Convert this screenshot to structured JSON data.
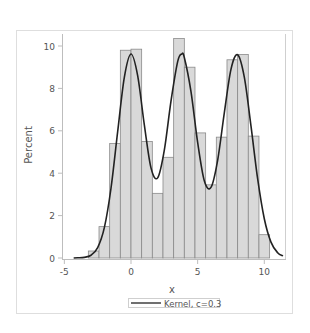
{
  "chart_data": {
    "type": "bar",
    "subtype": "histogram_with_kernel_density",
    "title": "",
    "xlabel": "x",
    "ylabel": "Percent",
    "xlim": [
      -5,
      11.5
    ],
    "ylim": [
      0,
      10.5
    ],
    "xticks": [
      -5,
      0,
      5,
      10
    ],
    "yticks": [
      0,
      2,
      4,
      6,
      8,
      10
    ],
    "grid": false,
    "legend_position": "bottom-center",
    "bin_width": 0.8,
    "bins": [
      {
        "left": -3.2,
        "right": -2.4,
        "value": 0.33
      },
      {
        "left": -2.4,
        "right": -1.6,
        "value": 1.48
      },
      {
        "left": -1.6,
        "right": -0.8,
        "value": 5.4
      },
      {
        "left": -0.8,
        "right": 0.0,
        "value": 9.8
      },
      {
        "left": 0.0,
        "right": 0.8,
        "value": 9.85
      },
      {
        "left": 0.8,
        "right": 1.6,
        "value": 5.5
      },
      {
        "left": 1.6,
        "right": 2.4,
        "value": 3.05
      },
      {
        "left": 2.4,
        "right": 3.2,
        "value": 4.75
      },
      {
        "left": 3.2,
        "right": 4.0,
        "value": 10.35
      },
      {
        "left": 4.0,
        "right": 4.8,
        "value": 9.0
      },
      {
        "left": 4.8,
        "right": 5.6,
        "value": 5.9
      },
      {
        "left": 5.6,
        "right": 6.4,
        "value": 3.45
      },
      {
        "left": 6.4,
        "right": 7.2,
        "value": 5.7
      },
      {
        "left": 7.2,
        "right": 8.0,
        "value": 9.35
      },
      {
        "left": 8.0,
        "right": 8.8,
        "value": 9.6
      },
      {
        "left": 8.8,
        "right": 9.6,
        "value": 5.75
      },
      {
        "left": 9.6,
        "right": 10.4,
        "value": 1.1
      }
    ],
    "categories": [
      "-2.8",
      "-2.0",
      "-1.2",
      "-0.4",
      "0.4",
      "1.2",
      "2.0",
      "2.8",
      "3.6",
      "4.4",
      "5.2",
      "6.0",
      "6.8",
      "7.6",
      "8.4",
      "9.2",
      "10.0"
    ],
    "values": [
      0.33,
      1.48,
      5.4,
      9.8,
      9.85,
      5.5,
      3.05,
      4.75,
      10.35,
      9.0,
      5.9,
      3.45,
      5.7,
      9.35,
      9.6,
      5.75,
      1.1
    ],
    "series": [
      {
        "name": "Kernel, c=0.3",
        "type": "line",
        "x": [
          -4.3,
          -4.0,
          -3.5,
          -3.0,
          -2.5,
          -2.0,
          -1.5,
          -1.0,
          -0.5,
          0.0,
          0.5,
          1.0,
          1.5,
          2.0,
          2.5,
          3.0,
          3.5,
          3.8,
          4.0,
          4.5,
          5.0,
          5.5,
          6.0,
          6.5,
          7.0,
          7.5,
          8.0,
          8.5,
          9.0,
          9.5,
          10.0,
          10.5,
          11.0,
          11.4
        ],
        "y": [
          0.0,
          0.01,
          0.03,
          0.13,
          0.49,
          1.43,
          3.29,
          5.96,
          8.52,
          9.62,
          8.6,
          6.28,
          4.25,
          3.78,
          5.09,
          7.4,
          9.26,
          9.62,
          9.46,
          7.85,
          5.45,
          3.64,
          3.33,
          4.61,
          6.85,
          8.9,
          9.59,
          8.53,
          6.23,
          3.74,
          1.85,
          0.75,
          0.25,
          0.1
        ]
      }
    ],
    "legend": [
      {
        "label": "Kernel, c=0.3",
        "symbol": "line",
        "color": "#222222"
      }
    ],
    "colors": {
      "bar_fill": "#d9d9d9",
      "bar_outline": "#8a8a8a",
      "curve": "#222222",
      "axis": "#bdbdbd",
      "frame": "#dedede",
      "text": "#555555"
    }
  }
}
